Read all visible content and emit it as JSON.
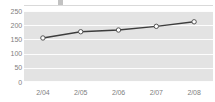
{
  "chart_data": {
    "type": "line",
    "title": "",
    "xlabel": "",
    "ylabel": "",
    "categories": [
      "2/04",
      "2/05",
      "2/06",
      "2/07",
      "2/08"
    ],
    "values": [
      155,
      177,
      183,
      196,
      212
    ],
    "series": [
      {
        "name": "series-1",
        "values": [
          155,
          177,
          183,
          196,
          212
        ]
      }
    ],
    "ylim": [
      0,
      250
    ],
    "ytick_labels": [
      "250",
      "200",
      "150",
      "100",
      "50",
      "0"
    ],
    "yticks": [
      250,
      200,
      150,
      100,
      50,
      0
    ],
    "grid": true,
    "grid_orientation": "horizontal",
    "legend": false,
    "legend_position": "none",
    "marker": "open-circle",
    "colors": {
      "plot_background": "#e3e3e3",
      "gridline": "#fdfdfd",
      "line": "#3d3d3d",
      "marker_fill": "#ffffff",
      "marker_stroke": "#555555",
      "tick_label": "#808080",
      "page_background": "#ffffff",
      "top_rule": "#d9d9d9"
    }
  }
}
